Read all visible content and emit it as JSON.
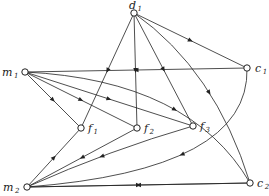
{
  "diagram": {
    "type": "directed-graph",
    "nodes": [
      {
        "id": "d1",
        "letter": "d",
        "sub": "1"
      },
      {
        "id": "m1",
        "letter": "m",
        "sub": "1"
      },
      {
        "id": "c1",
        "letter": "c",
        "sub": "1"
      },
      {
        "id": "f1",
        "letter": "f",
        "sub": "1"
      },
      {
        "id": "f2",
        "letter": "f",
        "sub": "2"
      },
      {
        "id": "f3",
        "letter": "f",
        "sub": "3"
      },
      {
        "id": "m2",
        "letter": "m",
        "sub": "2"
      },
      {
        "id": "c2",
        "letter": "c",
        "sub": "2"
      }
    ],
    "edges": [
      {
        "from": "d1",
        "to": "f1"
      },
      {
        "from": "d1",
        "to": "f2"
      },
      {
        "from": "d1",
        "to": "f3"
      },
      {
        "from": "d1",
        "to": "c1"
      },
      {
        "from": "d1",
        "to": "c2"
      },
      {
        "from": "c1",
        "to": "m1"
      },
      {
        "from": "m1",
        "to": "f1"
      },
      {
        "from": "m1",
        "to": "f2"
      },
      {
        "from": "m1",
        "to": "f3"
      },
      {
        "from": "m1",
        "to": "c2"
      },
      {
        "from": "m2",
        "to": "f1"
      },
      {
        "from": "f2",
        "to": "m2"
      },
      {
        "from": "f3",
        "to": "m2"
      },
      {
        "from": "c1",
        "to": "m2"
      },
      {
        "from": "m2",
        "to": "c2"
      },
      {
        "from": "c2",
        "to": "m2"
      }
    ]
  }
}
